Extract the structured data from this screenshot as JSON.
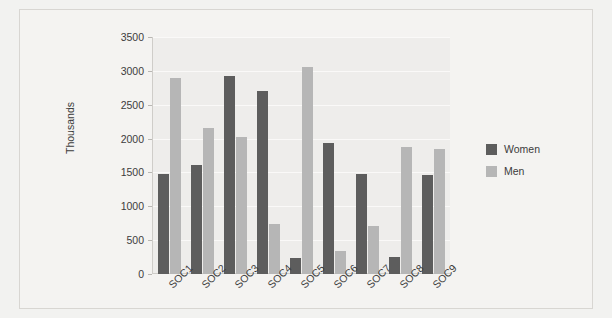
{
  "chart_data": {
    "type": "bar",
    "title": "",
    "xlabel": "",
    "ylabel": "Thousands",
    "ylim": [
      0,
      3500
    ],
    "ytick_values": [
      0,
      500,
      1000,
      1500,
      2000,
      2500,
      3000,
      3500
    ],
    "ytick_labels": [
      "0",
      "500",
      "1000",
      "1500",
      "2000",
      "2500",
      "3000",
      "3500"
    ],
    "grid": true,
    "legend_position": "right",
    "categories": [
      "SOC1",
      "SOC2",
      "SOC3",
      "SOC4",
      "SOC5",
      "SOC6",
      "SOC7",
      "SOC8",
      "SOC9"
    ],
    "series": [
      {
        "name": "Women",
        "color": "#5d5d5d",
        "values": [
          1480,
          1610,
          2930,
          2700,
          240,
          1935,
          1470,
          250,
          1460
        ]
      },
      {
        "name": "Men",
        "color": "#b6b6b6",
        "values": [
          2900,
          2160,
          2030,
          735,
          3050,
          340,
          710,
          1880,
          1850
        ]
      }
    ]
  },
  "legend": {
    "items": [
      {
        "label": "Women"
      },
      {
        "label": "Men"
      }
    ]
  }
}
